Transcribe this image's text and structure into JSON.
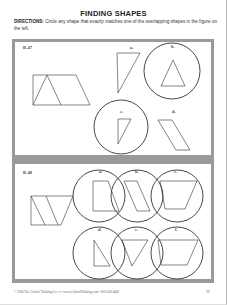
{
  "page": {
    "title": "FINDING SHAPES",
    "directions_label": "DIRECTIONS:",
    "directions_text": " Circle any shape that exactly matches one of the overlapping shapes in the figure on the left.",
    "footer": "© 2006 The Critical Thinking Co.™ • www.CriticalThinking.com • 800-458-4849",
    "page_number": "29"
  },
  "colors": {
    "frame_gray": "#9a9a9a",
    "ink": "#222222",
    "paper": "#ffffff"
  },
  "problems": [
    {
      "id": "B-47",
      "label": "B-47",
      "figure": "square-with-triangle-and-parallelogram",
      "options": [
        {
          "letter": "a.",
          "shape": "right-triangle-thin",
          "circled": false
        },
        {
          "letter": "b.",
          "shape": "isosceles-triangle",
          "circled": true
        },
        {
          "letter": "c.",
          "shape": "right-triangle-small",
          "circled": true
        },
        {
          "letter": "d.",
          "shape": "parallelogram",
          "circled": false
        }
      ]
    },
    {
      "id": "B-48",
      "label": "B-48",
      "figure": "trapezoid-with-slanted-dividers",
      "options": [
        {
          "letter": "a.",
          "shape": "trapezoid-right",
          "circled": true
        },
        {
          "letter": "b.",
          "shape": "parallelogram",
          "circled": true
        },
        {
          "letter": "c.",
          "shape": "inverted-trapezoid",
          "circled": true
        },
        {
          "letter": "d.",
          "shape": "right-triangle",
          "circled": true
        },
        {
          "letter": "e.",
          "shape": "inverted-triangle",
          "circled": true
        },
        {
          "letter": "f.",
          "shape": "trapezoid-wide",
          "circled": true
        }
      ]
    }
  ]
}
